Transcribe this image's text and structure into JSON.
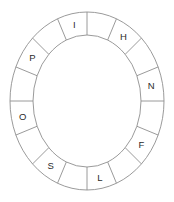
{
  "figure": {
    "name": "letter-ring-wheel",
    "background_color": "#ffffff",
    "stroke_color": "#8e8e8e",
    "letter_color": "#2b2b2b",
    "segment_count": 16,
    "geometry": {
      "center_x": 87,
      "center_y": 101,
      "outer_radius_x": 77,
      "outer_radius_y": 89,
      "inner_radius_x": 54,
      "inner_radius_y": 66,
      "start_angle_deg": -90,
      "segment_span_deg": 22.5
    },
    "segments": [
      {
        "index": 0,
        "letter": "",
        "angle_deg": -78.75
      },
      {
        "index": 1,
        "letter": "H",
        "angle_deg": -56.25
      },
      {
        "index": 2,
        "letter": "",
        "angle_deg": -33.75
      },
      {
        "index": 3,
        "letter": "N",
        "angle_deg": -11.25
      },
      {
        "index": 4,
        "letter": "",
        "angle_deg": 11.25
      },
      {
        "index": 5,
        "letter": "F",
        "angle_deg": 33.75
      },
      {
        "index": 6,
        "letter": "",
        "angle_deg": 56.25
      },
      {
        "index": 7,
        "letter": "L",
        "angle_deg": 78.75
      },
      {
        "index": 8,
        "letter": "",
        "angle_deg": 101.25
      },
      {
        "index": 9,
        "letter": "S",
        "angle_deg": 123.75
      },
      {
        "index": 10,
        "letter": "",
        "angle_deg": 146.25
      },
      {
        "index": 11,
        "letter": "O",
        "angle_deg": 168.75
      },
      {
        "index": 12,
        "letter": "",
        "angle_deg": 191.25
      },
      {
        "index": 13,
        "letter": "P",
        "angle_deg": 213.75
      },
      {
        "index": 14,
        "letter": "",
        "angle_deg": 236.25
      },
      {
        "index": 15,
        "letter": "I",
        "angle_deg": 258.75
      }
    ],
    "letters_clockwise_from_top": [
      "I",
      "H",
      "N",
      "F",
      "L",
      "S",
      "O",
      "P"
    ]
  }
}
